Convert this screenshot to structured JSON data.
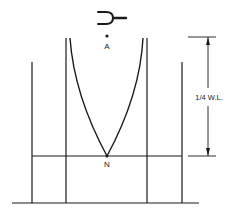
{
  "diagram": {
    "labels": {
      "source_point": "A",
      "node_point": "N",
      "dimension": "1/4 W.L."
    },
    "elements": {
      "source_icon": "tuning-fork-icon",
      "displacement_curve": "pressure/displacement envelope converging at node",
      "outer_tube": "outer resonance tube walls",
      "inner_tube": "inner resonance tube walls",
      "water_level": "water surface line",
      "base": "ground line"
    },
    "colors": {
      "stroke": "#1a1a1a",
      "background": "#ffffff"
    }
  }
}
